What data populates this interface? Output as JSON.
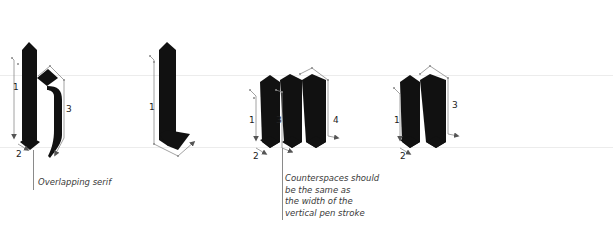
{
  "figure": {
    "guides": {
      "x_height_y": 75,
      "baseline_y": 147,
      "color": "#ececec"
    },
    "colors": {
      "ink": "#111111",
      "arrow": "#8a8a8a",
      "arrowhead": "#555555",
      "text": "#3a3a3a"
    },
    "letters": [
      {
        "glyph": "k",
        "strokes": [
          "1",
          "2",
          "3"
        ]
      },
      {
        "glyph": "l",
        "strokes": [
          "1"
        ]
      },
      {
        "glyph": "m",
        "strokes": [
          "1",
          "2",
          "3",
          "4"
        ]
      },
      {
        "glyph": "n",
        "strokes": [
          "1",
          "2",
          "3"
        ]
      },
      {
        "glyph": "o",
        "strokes": [
          "1",
          "2"
        ]
      }
    ],
    "annotations": {
      "overlapping_serif": "Overlapping serif",
      "counterspaces": [
        "Counterspaces should",
        "be the same as",
        "the width of the",
        "vertical pen stroke"
      ]
    }
  }
}
